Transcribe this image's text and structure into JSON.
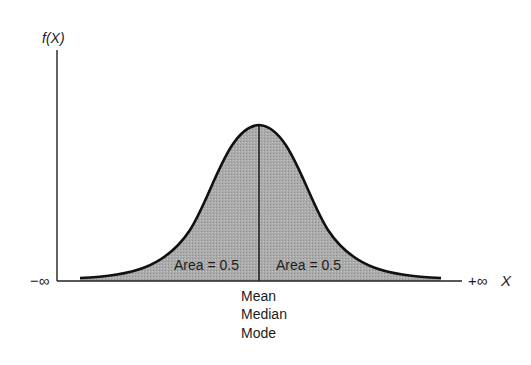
{
  "diagram": {
    "type": "normal-distribution",
    "y_axis_label": "f(X)",
    "x_axis_label": "X",
    "x_left_label": "−∞",
    "x_right_label": "+∞",
    "left_area_label": "Area = 0.5",
    "right_area_label": "Area = 0.5",
    "center_labels": [
      "Mean",
      "Median",
      "Mode"
    ],
    "colors": {
      "fill": "#a9a9a9",
      "stroke": "#111111",
      "axis": "#222222"
    }
  }
}
